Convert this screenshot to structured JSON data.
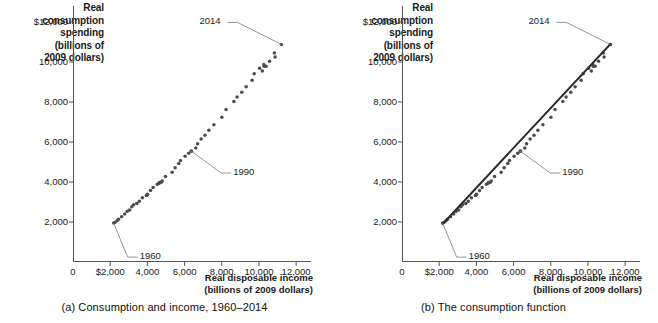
{
  "figure": {
    "panels": [
      {
        "id": "a",
        "caption": "(a) Consumption and income, 1960–2014",
        "show_fit_line": false
      },
      {
        "id": "b",
        "caption": "(b) The consumption function",
        "show_fit_line": true
      }
    ],
    "axis": {
      "ylabel": "Real\nconsumption\nspending\n(billions of\n2009 dollars)",
      "xlabel": "Real disposable income\n(billions of 2009 dollars)",
      "y_ticks": [
        "$12,000",
        "10,000",
        "8,000",
        "6,000",
        "4,000",
        "2,000"
      ],
      "x_ticks": [
        "0",
        "$2,000",
        "4,000",
        "6,000",
        "8,000",
        "10,000",
        "12,000"
      ]
    },
    "annotations": [
      {
        "label": "1960"
      },
      {
        "label": "1990"
      },
      {
        "label": "2014"
      }
    ],
    "colors": {
      "dot": "#4b4b52",
      "line": "#2b2b2b",
      "axis": "#555555",
      "leader": "#8a8a8a",
      "text": "#1a1a1a"
    }
  },
  "chart_data": {
    "type": "scatter",
    "title": "Consumption and income, 1960–2014",
    "xlabel": "Real disposable income (billions of 2009 dollars)",
    "ylabel": "Real consumption spending (billions of 2009 dollars)",
    "xlim": [
      0,
      12800
    ],
    "ylim": [
      0,
      12800
    ],
    "x_ticks": [
      0,
      2000,
      4000,
      6000,
      8000,
      10000,
      12000
    ],
    "y_ticks": [
      2000,
      4000,
      6000,
      8000,
      10000,
      12000
    ],
    "grid": false,
    "legend": null,
    "series": [
      {
        "name": "Consumption vs disposable income",
        "points": [
          {
            "year": 1960,
            "x": 2187,
            "y": 1944
          },
          {
            "year": 1961,
            "x": 2257,
            "y": 1971
          },
          {
            "year": 1962,
            "x": 2371,
            "y": 2062
          },
          {
            "year": 1963,
            "x": 2448,
            "y": 2137
          },
          {
            "year": 1964,
            "x": 2613,
            "y": 2261
          },
          {
            "year": 1965,
            "x": 2782,
            "y": 2404
          },
          {
            "year": 1966,
            "x": 2915,
            "y": 2536
          },
          {
            "year": 1967,
            "x": 3046,
            "y": 2605
          },
          {
            "year": 1968,
            "x": 3166,
            "y": 2757
          },
          {
            "year": 1969,
            "x": 3261,
            "y": 2864
          },
          {
            "year": 1970,
            "x": 3433,
            "y": 2921
          },
          {
            "year": 1971,
            "x": 3565,
            "y": 3033
          },
          {
            "year": 1972,
            "x": 3731,
            "y": 3217
          },
          {
            "year": 1973,
            "x": 3982,
            "y": 3356
          },
          {
            "year": 1974,
            "x": 3947,
            "y": 3323
          },
          {
            "year": 1975,
            "x": 4010,
            "y": 3386
          },
          {
            "year": 1976,
            "x": 4167,
            "y": 3570
          },
          {
            "year": 1977,
            "x": 4310,
            "y": 3722
          },
          {
            "year": 1978,
            "x": 4537,
            "y": 3884
          },
          {
            "year": 1979,
            "x": 4648,
            "y": 3971
          },
          {
            "year": 1980,
            "x": 4637,
            "y": 3936
          },
          {
            "year": 1981,
            "x": 4745,
            "y": 3986
          },
          {
            "year": 1982,
            "x": 4799,
            "y": 4052
          },
          {
            "year": 1983,
            "x": 4974,
            "y": 4280
          },
          {
            "year": 1984,
            "x": 5333,
            "y": 4486
          },
          {
            "year": 1985,
            "x": 5492,
            "y": 4713
          },
          {
            "year": 1986,
            "x": 5687,
            "y": 4922
          },
          {
            "year": 1987,
            "x": 5781,
            "y": 5074
          },
          {
            "year": 1988,
            "x": 6027,
            "y": 5288
          },
          {
            "year": 1989,
            "x": 6222,
            "y": 5438
          },
          {
            "year": 1990,
            "x": 6357,
            "y": 5550
          },
          {
            "year": 1991,
            "x": 6376,
            "y": 5534
          },
          {
            "year": 1992,
            "x": 6603,
            "y": 5700
          },
          {
            "year": 1993,
            "x": 6702,
            "y": 5917
          },
          {
            "year": 1994,
            "x": 6890,
            "y": 6144
          },
          {
            "year": 1995,
            "x": 7099,
            "y": 6342
          },
          {
            "year": 1996,
            "x": 7307,
            "y": 6585
          },
          {
            "year": 1997,
            "x": 7578,
            "y": 6858
          },
          {
            "year": 1998,
            "x": 8009,
            "y": 7232
          },
          {
            "year": 1999,
            "x": 8231,
            "y": 7629
          },
          {
            "year": 2000,
            "x": 8652,
            "y": 8026
          },
          {
            "year": 2001,
            "x": 8824,
            "y": 8248
          },
          {
            "year": 2002,
            "x": 9077,
            "y": 8483
          },
          {
            "year": 2003,
            "x": 9314,
            "y": 8757
          },
          {
            "year": 2004,
            "x": 9632,
            "y": 9089
          },
          {
            "year": 2005,
            "x": 9745,
            "y": 9413
          },
          {
            "year": 2006,
            "x": 10035,
            "y": 9682
          },
          {
            "year": 2007,
            "x": 10263,
            "y": 9877
          },
          {
            "year": 2008,
            "x": 10280,
            "y": 9787
          },
          {
            "year": 2009,
            "x": 10180,
            "y": 9554
          },
          {
            "year": 2010,
            "x": 10388,
            "y": 9784
          },
          {
            "year": 2011,
            "x": 10570,
            "y": 10040
          },
          {
            "year": 2012,
            "x": 10870,
            "y": 10246
          },
          {
            "year": 2013,
            "x": 10830,
            "y": 10450
          },
          {
            "year": 2014,
            "x": 11210,
            "y": 10880
          }
        ]
      }
    ],
    "fit_line": {
      "name": "Consumption function",
      "x0": 2187,
      "y0": 1900,
      "x1": 11210,
      "y1": 10900,
      "slope": 0.997,
      "intercept": -280
    },
    "annotations": [
      {
        "label": "1960",
        "x": 2187,
        "y": 1944
      },
      {
        "label": "1990",
        "x": 6357,
        "y": 5550
      },
      {
        "label": "2014",
        "x": 11210,
        "y": 10880
      }
    ]
  }
}
